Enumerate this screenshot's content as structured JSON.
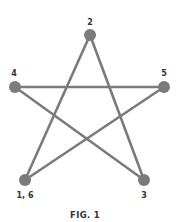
{
  "figure": {
    "caption": "FIG. 1",
    "line_color": "#7b7b7b",
    "node_color": "#7b7b7b",
    "label_color": "#333333",
    "nodes": [
      {
        "id": "n16",
        "label": "1, 6",
        "x": 25,
        "y": 180
      },
      {
        "id": "n2",
        "label": "2",
        "x": 90,
        "y": 35
      },
      {
        "id": "n3",
        "label": "3",
        "x": 144,
        "y": 180
      },
      {
        "id": "n4",
        "label": "4",
        "x": 15,
        "y": 87
      },
      {
        "id": "n5",
        "label": "5",
        "x": 164,
        "y": 87
      }
    ],
    "path_order": [
      "1",
      "2",
      "3",
      "4",
      "5",
      "6"
    ]
  }
}
